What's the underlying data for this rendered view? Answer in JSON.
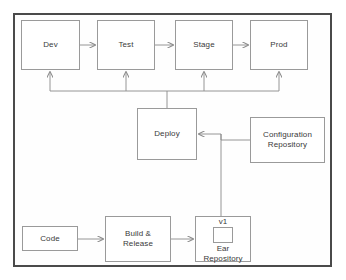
{
  "diagram": {
    "type": "flow-diagram",
    "colors": {
      "frame_border": "#4a4a4a",
      "node_border": "#9a9a9a",
      "node_fill": "#ffffff",
      "connector": "#8a8a8a",
      "text": "#3a3a3a",
      "background": "#ffffff"
    },
    "nodes": {
      "dev": {
        "label": "Dev",
        "x": 21,
        "y": 20,
        "w": 59,
        "h": 50
      },
      "test": {
        "label": "Test",
        "x": 97,
        "y": 20,
        "w": 58,
        "h": 50
      },
      "stage": {
        "label": "Stage",
        "x": 175,
        "y": 20,
        "w": 58,
        "h": 50
      },
      "prod": {
        "label": "Prod",
        "x": 250,
        "y": 20,
        "w": 58,
        "h": 50
      },
      "deploy": {
        "label": "Deploy",
        "x": 137,
        "y": 108,
        "w": 60,
        "h": 52
      },
      "configuration_repository": {
        "label": "Configuration Repository",
        "line1": "Configuration",
        "line2": "Repository",
        "x": 250,
        "y": 117,
        "w": 75,
        "h": 46
      },
      "code": {
        "label": "Code",
        "x": 22,
        "y": 226,
        "w": 56,
        "h": 25
      },
      "build_release": {
        "label": "Build & Release",
        "line1": "Build &",
        "line2": "Release",
        "x": 105,
        "y": 216,
        "w": 66,
        "h": 46
      },
      "ear_repository": {
        "label": "Ear Repository",
        "version": "v1",
        "line1": "Ear",
        "line2": "Repository",
        "x": 195,
        "y": 216,
        "w": 56,
        "h": 46
      }
    },
    "edges": [
      {
        "from": "dev",
        "to": "test",
        "arrow": "right"
      },
      {
        "from": "test",
        "to": "stage",
        "arrow": "right"
      },
      {
        "from": "stage",
        "to": "prod",
        "arrow": "right"
      },
      {
        "from": "deploy",
        "to": "dev",
        "arrow": "up"
      },
      {
        "from": "deploy",
        "to": "test",
        "arrow": "up"
      },
      {
        "from": "deploy",
        "to": "stage",
        "arrow": "up"
      },
      {
        "from": "deploy",
        "to": "prod",
        "arrow": "up"
      },
      {
        "from": "configuration_repository",
        "to": "deploy",
        "arrow": "left"
      },
      {
        "from": "ear_repository",
        "to": "deploy",
        "arrow": "left"
      },
      {
        "from": "code",
        "to": "build_release",
        "arrow": "right"
      },
      {
        "from": "build_release",
        "to": "ear_repository",
        "arrow": "right"
      }
    ]
  }
}
